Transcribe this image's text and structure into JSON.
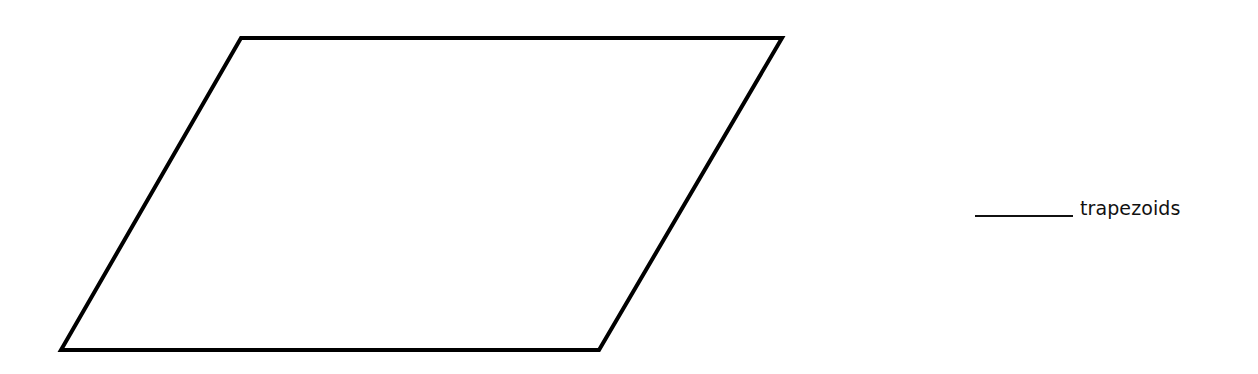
{
  "figure": {
    "shape": "parallelogram",
    "vertices": {
      "top_left": [
        241,
        38
      ],
      "top_right": [
        782,
        38
      ],
      "bottom_right": [
        599,
        350
      ],
      "bottom_left": [
        61,
        350
      ]
    },
    "stroke_color": "#000000",
    "fill_color": "#ffffff"
  },
  "answer": {
    "blank": "",
    "label": "trapezoids"
  }
}
